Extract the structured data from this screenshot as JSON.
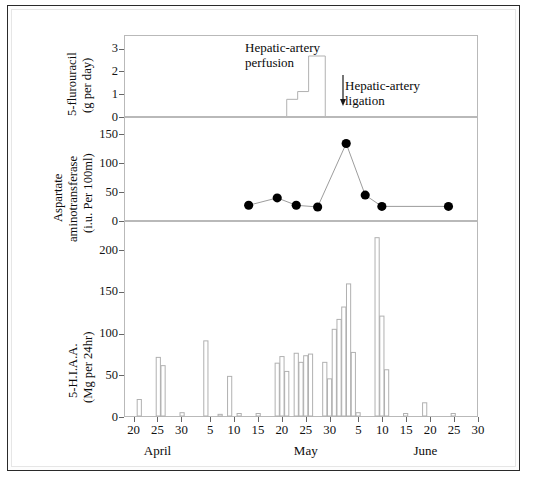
{
  "figure": {
    "title": "",
    "annotations": [
      {
        "id": "perfusion",
        "text": "Hepatic-artery\nperfusion"
      },
      {
        "id": "ligation",
        "text": "Hepatic-artery\nligation"
      }
    ]
  },
  "axes": {
    "x": {
      "label": "",
      "months": [
        {
          "name": "April",
          "center_day": 25
        },
        {
          "name": "May",
          "center_day": 56
        },
        {
          "name": "June",
          "center_day": 81
        }
      ],
      "ticks": [
        {
          "day": 20,
          "label": "20"
        },
        {
          "day": 25,
          "label": "25"
        },
        {
          "day": 30,
          "label": "30"
        },
        {
          "day": 36,
          "label": "5"
        },
        {
          "day": 41,
          "label": "10"
        },
        {
          "day": 46,
          "label": "15"
        },
        {
          "day": 51,
          "label": "20"
        },
        {
          "day": 56,
          "label": "25"
        },
        {
          "day": 61,
          "label": "30"
        },
        {
          "day": 67,
          "label": "5"
        },
        {
          "day": 72,
          "label": "10"
        },
        {
          "day": 77,
          "label": "15"
        },
        {
          "day": 82,
          "label": "20"
        },
        {
          "day": 87,
          "label": "25"
        },
        {
          "day": 92,
          "label": "30"
        }
      ],
      "range": [
        18,
        92
      ]
    }
  },
  "chart_data": [
    {
      "id": "fluorouracil",
      "type": "area",
      "title": "5-flurouracil",
      "ylabel_line1": "5-flurouracil",
      "ylabel_line2": "(g per day)",
      "ylabel": "5-flurouracil (g per day)",
      "yticks": [
        0,
        1,
        2,
        3
      ],
      "ylim": [
        0,
        3.6
      ],
      "xlabel": "",
      "grid": false,
      "steps": [
        {
          "day_start": 52.0,
          "day_end": 54.3,
          "value": 0.75
        },
        {
          "day_start": 54.3,
          "day_end": 56.6,
          "value": 1.1
        },
        {
          "day_start": 56.6,
          "day_end": 60.1,
          "value": 2.7
        }
      ]
    },
    {
      "id": "aspartate-aminotransferase",
      "type": "line",
      "title": "Aspartate aminotransferase",
      "ylabel_line1": "Aspartate",
      "ylabel_line2": "aminotransferase",
      "ylabel_line3": "(i.u. Per 100ml)",
      "ylabel": "Aspartate aminotransferase (i.u. Per 100ml)",
      "yticks": [
        0,
        50,
        100,
        150
      ],
      "ylim": [
        0,
        180
      ],
      "xlabel": "",
      "grid": false,
      "marker": "filled-circle",
      "points": [
        {
          "day": 44.0,
          "value": 26
        },
        {
          "day": 50.0,
          "value": 39
        },
        {
          "day": 54.0,
          "value": 26
        },
        {
          "day": 58.5,
          "value": 23
        },
        {
          "day": 64.5,
          "value": 135
        },
        {
          "day": 68.5,
          "value": 44
        },
        {
          "day": 72.0,
          "value": 24
        },
        {
          "day": 86.0,
          "value": 24
        }
      ]
    },
    {
      "id": "hiaa",
      "type": "bar",
      "title": "5-H.I.A.A.",
      "ylabel_line1": "5-H.I.A.A.",
      "ylabel_line2": "(Mg per 24hr)",
      "ylabel": "5-H.I.A.A. (Mg per 24hr)",
      "yticks": [
        0,
        50,
        100,
        150,
        200
      ],
      "ylim": [
        0,
        235
      ],
      "xlabel": "",
      "grid": false,
      "bars": [
        {
          "day": 21,
          "value": 20
        },
        {
          "day": 25,
          "value": 71
        },
        {
          "day": 26,
          "value": 61
        },
        {
          "day": 30,
          "value": 4
        },
        {
          "day": 35,
          "value": 91
        },
        {
          "day": 38,
          "value": 2
        },
        {
          "day": 40,
          "value": 48
        },
        {
          "day": 42,
          "value": 3
        },
        {
          "day": 46,
          "value": 3
        },
        {
          "day": 50,
          "value": 64
        },
        {
          "day": 51,
          "value": 72
        },
        {
          "day": 52,
          "value": 54
        },
        {
          "day": 54,
          "value": 76
        },
        {
          "day": 55,
          "value": 65
        },
        {
          "day": 56,
          "value": 73
        },
        {
          "day": 57,
          "value": 75
        },
        {
          "day": 60,
          "value": 65
        },
        {
          "day": 61,
          "value": 45
        },
        {
          "day": 62,
          "value": 105
        },
        {
          "day": 63,
          "value": 117
        },
        {
          "day": 64,
          "value": 132
        },
        {
          "day": 65,
          "value": 160
        },
        {
          "day": 66,
          "value": 77
        },
        {
          "day": 67,
          "value": 4
        },
        {
          "day": 71,
          "value": 216
        },
        {
          "day": 72,
          "value": 121
        },
        {
          "day": 73,
          "value": 56
        },
        {
          "day": 77,
          "value": 3
        },
        {
          "day": 81,
          "value": 16
        },
        {
          "day": 87,
          "value": 3
        }
      ]
    }
  ],
  "colors": {
    "frame": "#b9b9b9",
    "bar_stroke": "#b0b0b0",
    "marker": "#000000",
    "line": "#9a9a9a",
    "text": "#0c0c0c",
    "page_border": "#2a2a2a"
  }
}
